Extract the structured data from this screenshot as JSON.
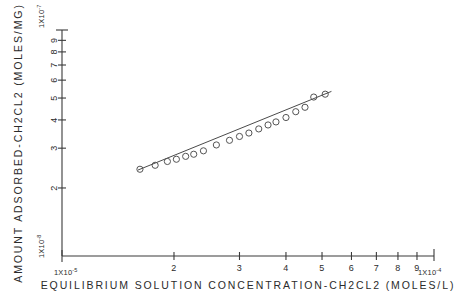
{
  "chart_data": {
    "type": "scatter",
    "title": "",
    "subtitle": "",
    "xlabel": "EQUILIBRIUM SOLUTION CONCENTRATION-CH2CL2  (MOLES/L)",
    "ylabel": "AMOUNT ADSORBED-CH2CL2  (MOLES/MG)",
    "xscale": "log",
    "yscale": "log",
    "grid": false,
    "legend": null,
    "xlim": [
      1e-05,
      0.0001
    ],
    "ylim": [
      1e-08,
      1e-07
    ],
    "x_decade_start_label": "1X10",
    "x_decade_start_exp": "-5",
    "x_decade_end_label": "1X10",
    "x_decade_end_exp": "-4",
    "y_decade_start_label": "1X10",
    "y_decade_start_exp": "-8",
    "y_decade_end_label": "1X10",
    "y_decade_end_exp": "-7",
    "x_tick_labels": [
      "2",
      "3",
      "4",
      "5",
      "6",
      "7",
      "8",
      "9"
    ],
    "x_tick_values": [
      2e-05,
      3e-05,
      4e-05,
      5e-05,
      6e-05,
      7e-05,
      8e-05,
      9e-05
    ],
    "y_tick_labels": [
      "2",
      "3",
      "4",
      "5",
      "6",
      "7",
      "8",
      "9"
    ],
    "y_tick_values": [
      2e-08,
      3e-08,
      4e-08,
      5e-08,
      6e-08,
      7e-08,
      8e-08,
      9e-08
    ],
    "marker_style": "open-circle",
    "series": [
      {
        "name": "CH2CL2 adsorption isotherm",
        "x": [
          1.62e-05,
          1.78e-05,
          1.92e-05,
          2.03e-05,
          2.15e-05,
          2.26e-05,
          2.4e-05,
          2.6e-05,
          2.82e-05,
          3e-05,
          3.18e-05,
          3.38e-05,
          3.58e-05,
          3.76e-05,
          4e-05,
          4.25e-05,
          4.5e-05,
          4.75e-05,
          5.1e-05
        ],
        "y": [
          2.42e-08,
          2.52e-08,
          2.62e-08,
          2.68e-08,
          2.76e-08,
          2.82e-08,
          2.92e-08,
          3.1e-08,
          3.25e-08,
          3.38e-08,
          3.5e-08,
          3.65e-08,
          3.8e-08,
          3.92e-08,
          4.1e-08,
          4.35e-08,
          4.55e-08,
          5.05e-08,
          5.2e-08
        ]
      }
    ],
    "fit_line": {
      "name": "least-squares fit",
      "x_start": 1.6e-05,
      "y_start": 2.4e-08,
      "x_end": 5.3e-05,
      "y_end": 5.35e-08
    }
  }
}
